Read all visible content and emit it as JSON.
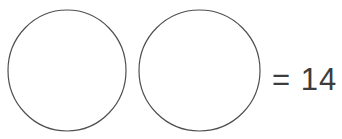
{
  "page": {
    "background_color": "#ffffff",
    "width": 342,
    "height": 139
  },
  "problem": {
    "type": "shape-equation",
    "equals_sign": "=",
    "result_value": "14",
    "expression": "= 14"
  },
  "shapes": {
    "stroke_color": "#4f4f4f",
    "fill_color": "none",
    "stroke_width": 1.2,
    "items": [
      {
        "name": "circle-1",
        "shape": "circle",
        "cx": 67,
        "cy": 70.5,
        "rx": 59,
        "ry": 60.5
      },
      {
        "name": "circle-2",
        "shape": "circle",
        "cx": 199.5,
        "cy": 70.5,
        "rx": 60.5,
        "ry": 60.5
      }
    ]
  },
  "text_color": "#3d3d3d"
}
